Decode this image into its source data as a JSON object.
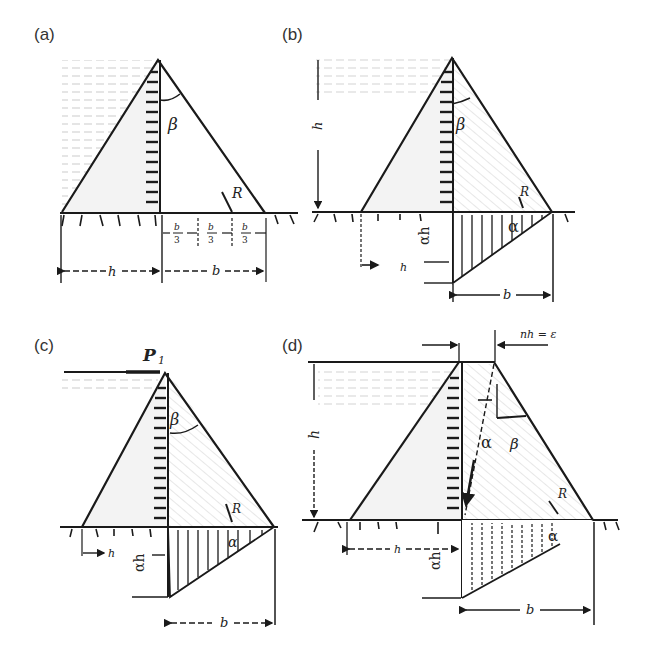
{
  "figure": {
    "panels": [
      {
        "id": "a",
        "label": "(a)",
        "symbols": {
          "angle_top": "β",
          "resultant": "R",
          "height": "h",
          "base": "b",
          "third": "b/3",
          "third_num": "b",
          "third_den": "3"
        },
        "uplift": false
      },
      {
        "id": "b",
        "label": "(b)",
        "symbols": {
          "angle_top": "β",
          "resultant": "R",
          "height": "h",
          "base": "b",
          "uplift_angle": "α",
          "uplift_height": "αh",
          "h_mark": "h"
        },
        "uplift": true
      },
      {
        "id": "c",
        "label": "(c)",
        "symbols": {
          "force": "P",
          "force_sub": "1",
          "angle_top": "β",
          "resultant": "R",
          "height": "h",
          "base": "b",
          "uplift_angle": "α",
          "uplift_height": "αh"
        },
        "uplift": true
      },
      {
        "id": "d",
        "label": "(d)",
        "symbols": {
          "crest_offset": "nh = ε",
          "angle_upstream": "α",
          "angle_top": "β",
          "resultant": "R",
          "height": "h",
          "base": "b",
          "uplift_angle": "α",
          "uplift_height": "αh",
          "h_mark": "h"
        },
        "uplift": true
      }
    ]
  },
  "colors": {
    "ink": "#1a1a1a",
    "water_hatch": "#9a9a9a",
    "dam_shade": "#c8c8c8",
    "label": "#333333"
  }
}
